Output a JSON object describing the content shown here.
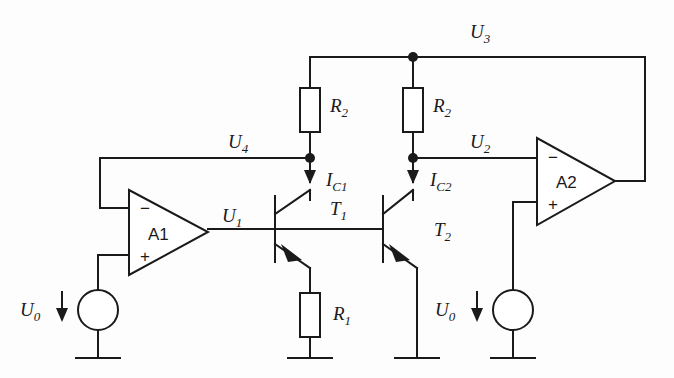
{
  "figure": {
    "type": "circuit-schematic"
  },
  "labels": {
    "u0_left": {
      "base": "U",
      "sub": "0"
    },
    "u0_right": {
      "base": "U",
      "sub": "0"
    },
    "u1": {
      "base": "U",
      "sub": "1"
    },
    "u2": {
      "base": "U",
      "sub": "2"
    },
    "u3": {
      "base": "U",
      "sub": "3"
    },
    "u4": {
      "base": "U",
      "sub": "4"
    },
    "ic1": {
      "base": "I",
      "sub": "C1"
    },
    "ic2": {
      "base": "I",
      "sub": "C2"
    },
    "r1": {
      "base": "R",
      "sub": "1"
    },
    "r2_left": {
      "base": "R",
      "sub": "2"
    },
    "r2_right": {
      "base": "R",
      "sub": "2"
    },
    "t1": {
      "base": "T",
      "sub": "1"
    },
    "t2": {
      "base": "T",
      "sub": "2"
    }
  },
  "opamps": [
    {
      "id": "a1",
      "name": "A1",
      "minus": "−",
      "plus": "+"
    },
    {
      "id": "a2",
      "name": "A2",
      "minus": "−",
      "plus": "+"
    }
  ],
  "components": {
    "resistors": [
      {
        "name": "R2",
        "position": "left-collector-branch"
      },
      {
        "name": "R2",
        "position": "right-collector-branch"
      },
      {
        "name": "R1",
        "position": "T1-emitter-branch"
      }
    ],
    "transistors": [
      {
        "name": "T1",
        "kind": "npn"
      },
      {
        "name": "T2",
        "kind": "npn"
      }
    ],
    "sources": [
      {
        "name": "U0",
        "position": "left",
        "arrow": "down"
      },
      {
        "name": "U0",
        "position": "right",
        "arrow": "down"
      }
    ],
    "grounds": 4,
    "current_arrows": [
      {
        "name": "IC1",
        "direction": "down"
      },
      {
        "name": "IC2",
        "direction": "down"
      }
    ]
  },
  "colors": {
    "ink": "#1a1a1a",
    "background": "#fdfdfd",
    "fill": "#ffffff"
  }
}
